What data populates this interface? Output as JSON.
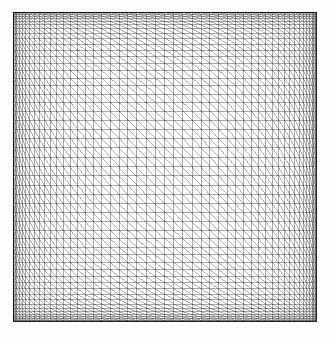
{
  "figure": {
    "kind": "graded-triangular-mesh",
    "title": "Graded triangular finite element mesh",
    "background_color": "#fdfdfd",
    "canvas_width": 329,
    "canvas_height": 337
  },
  "domain": {
    "x_min": 13,
    "y_min": 12,
    "x_max": 316,
    "y_max": 321,
    "width": 303,
    "height": 309,
    "shape": "square"
  },
  "mesh": {
    "divisions_x": 50,
    "divisions_y": 50,
    "node_count_x": 51,
    "node_count_y": 51,
    "total_nodes": 2601,
    "quad_cells": 2500,
    "triangle_elements": 5000,
    "diagonal_direction": "top-left-to-bottom-right",
    "diagonal_glyph": "\\",
    "element_type": "right-triangle",
    "grading": "boundary-refined",
    "grading_profile": "cosine",
    "grading_strength": 0.92,
    "min_spacing_px": 0.8,
    "max_spacing_px": 12.0,
    "symmetric": true
  },
  "style": {
    "line_color": "#1a1a1a",
    "line_width": 0.45,
    "grid_line_color": "#202020",
    "diagonal_line_color": "#303030",
    "border_color": "#000000",
    "border_width": 0.8,
    "opacity": 0.85
  },
  "chart_data": {
    "type": "mesh",
    "title": "Graded triangular finite element mesh",
    "xlabel": "",
    "ylabel": "",
    "xlim": [
      0,
      1
    ],
    "ylim": [
      0,
      1
    ],
    "grid": true,
    "legend": "none",
    "series": [
      {
        "name": "vertical grid lines",
        "count": 51,
        "orientation": "vertical",
        "spacing": "cosine-graded, fine at x=0 and x=1, coarse at x=0.5"
      },
      {
        "name": "horizontal grid lines",
        "count": 51,
        "orientation": "horizontal",
        "spacing": "cosine-graded, fine at y=0 and y=1, coarse at y=0.5"
      },
      {
        "name": "diagonals",
        "count": 2500,
        "orientation": "negative-slope",
        "spacing": "one per quad cell"
      }
    ]
  }
}
